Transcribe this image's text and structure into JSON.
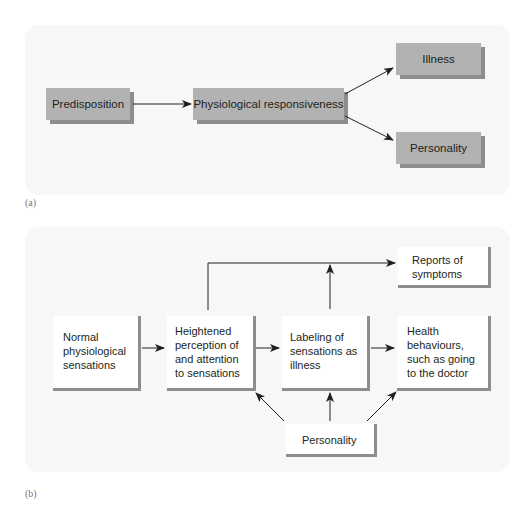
{
  "panel_a": {
    "label": "(a)",
    "nodes": {
      "predisposition": "Predisposition",
      "physiological_responsiveness": "Physiological responsiveness",
      "illness": "Illness",
      "personality": "Personality"
    },
    "edges": [
      [
        "Predisposition",
        "Physiological responsiveness"
      ],
      [
        "Physiological responsiveness",
        "Illness"
      ],
      [
        "Physiological responsiveness",
        "Personality"
      ]
    ]
  },
  "panel_b": {
    "label": "(b)",
    "nodes": {
      "normal_sensations": "Normal\nphysiological\nsensations",
      "heightened_perception": "Heightened\nperception of\nand attention\nto sensations",
      "labeling": "Labeling of\nsensations as\nillness",
      "health_behaviours": "Health\nbehaviours,\nsuch as going\nto the doctor",
      "reports_of_symptoms": "Reports of\nsymptoms",
      "personality": "Personality"
    },
    "edges": [
      [
        "Normal physiological sensations",
        "Heightened perception of and attention to sensations"
      ],
      [
        "Heightened perception of and attention to sensations",
        "Labeling of sensations as illness"
      ],
      [
        "Labeling of sensations as illness",
        "Health behaviours, such as going to the doctor"
      ],
      [
        "Heightened perception of and attention to sensations",
        "Reports of symptoms"
      ],
      [
        "Labeling of sensations as illness",
        "Reports of symptoms"
      ],
      [
        "Personality",
        "Heightened perception of and attention to sensations"
      ],
      [
        "Personality",
        "Labeling of sensations as illness"
      ],
      [
        "Personality",
        "Health behaviours, such as going to the doctor"
      ]
    ]
  },
  "colors": {
    "panel_bg": "#f7f7f7",
    "box_fill_a": "#b2b2b2",
    "box_shadow": "#8d8d8d",
    "line": "#231f20"
  }
}
